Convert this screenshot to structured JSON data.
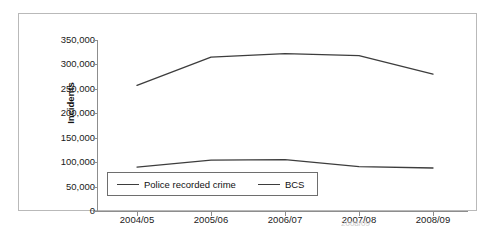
{
  "chart_data": {
    "type": "line",
    "title": "",
    "subtitle": "",
    "xlabel": "",
    "ylabel": "Incidents",
    "categories": [
      "2004/05",
      "2005/06",
      "2006/07",
      "2007/08",
      "2008/09"
    ],
    "ylim": [
      0,
      350000
    ],
    "y_ticks": [
      350000,
      300000,
      250000,
      200000,
      150000,
      100000,
      50000,
      0
    ],
    "y_tick_labels": [
      "350,000",
      "300,000",
      "250,000",
      "200,000",
      "150,000",
      "100,000",
      "50,000",
      "0"
    ],
    "grid": false,
    "legend_position": "inside-bottom-left",
    "series": [
      {
        "name": "Police recorded crime",
        "color": "#3d3d3d",
        "values": [
          90000,
          104000,
          105000,
          91000,
          88000
        ]
      },
      {
        "name": "BCS",
        "color": "#3d3d3d",
        "values": [
          257000,
          315000,
          322000,
          318000,
          280000
        ]
      }
    ]
  },
  "axes": {
    "y_title": "Incidents"
  },
  "legend": {
    "entries": [
      {
        "label": "Police recorded crime"
      },
      {
        "label": "BCS"
      }
    ]
  },
  "footer": {
    "clipped_text": "2008/09"
  },
  "colors": {
    "line": "#3d3d3d",
    "axis": "#8d8d8d",
    "frame": "#b9b9b9",
    "legend_border": "#6e6e6e",
    "text": "#1a1a1a"
  }
}
